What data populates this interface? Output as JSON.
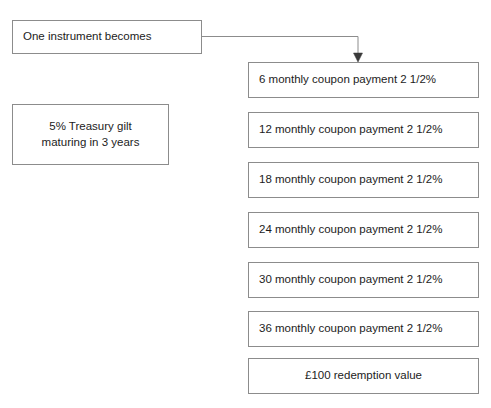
{
  "diagram": {
    "background_color": "#ffffff",
    "border_color": "#8c8c8c",
    "text_color": "#1c1c1c",
    "source_box": {
      "label": "One instrument becomes"
    },
    "instrument_box": {
      "line1": "5% Treasury gilt",
      "line2": "maturing in 3 years"
    },
    "cashflow_boxes": [
      {
        "label": "6 monthly coupon payment 2 1/2%",
        "align": "left"
      },
      {
        "label": "12 monthly coupon payment 2 1/2%",
        "align": "left"
      },
      {
        "label": "18 monthly coupon payment 2 1/2%",
        "align": "left"
      },
      {
        "label": "24 monthly coupon payment 2 1/2%",
        "align": "left"
      },
      {
        "label": "30 monthly coupon payment 2 1/2%",
        "align": "left"
      },
      {
        "label": "36 monthly coupon payment 2 1/2%",
        "align": "left"
      },
      {
        "label": "£100 redemption value",
        "align": "center"
      }
    ],
    "connector": {
      "kind": "elbow-arrow",
      "from": "source_box",
      "to": "cashflow_boxes.0"
    }
  }
}
